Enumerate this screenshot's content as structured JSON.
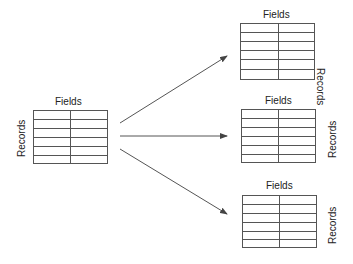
{
  "diagram": {
    "source_table": {
      "fields_label": "Fields",
      "records_label": "Records",
      "rows": 6,
      "columns": 2
    },
    "target_tables": [
      {
        "fields_label": "Fields",
        "records_label": "Records",
        "rows": 6,
        "columns": 2
      },
      {
        "fields_label": "Fields",
        "records_label": "Records",
        "rows": 6,
        "columns": 2
      },
      {
        "fields_label": "Fields",
        "records_label": "Records",
        "rows": 6,
        "columns": 2
      }
    ],
    "arrows": [
      {
        "from": "source_table",
        "to": "target_tables.0"
      },
      {
        "from": "source_table",
        "to": "target_tables.1"
      },
      {
        "from": "source_table",
        "to": "target_tables.2"
      }
    ],
    "colors": {
      "line": "#555555",
      "text": "#222222",
      "background": "#ffffff"
    }
  }
}
